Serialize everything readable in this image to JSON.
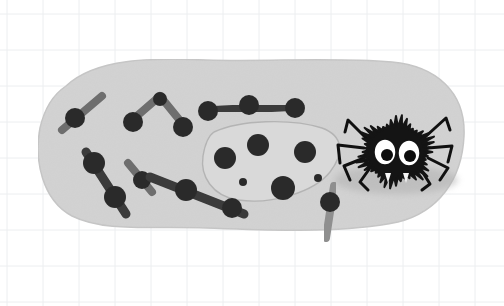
{
  "meta": {
    "title": "Spider on a rock illustration",
    "description": "Grayscale hand-drawn illustration on light grid paper: a fuzzy black cartoon spider with big white eyes sits on a large light-grey rounded blob, surrounded by matchstick-like shapes with dark round heads and an outlined inner patch containing dark dots.",
    "width": 504,
    "height": 306
  },
  "canvas": {
    "background_color": "#ffffff"
  },
  "grid": {
    "name": "graph-paper-grid",
    "line_color": "#eceef0",
    "line_width": 1,
    "spacing": 36,
    "offset_x": 7,
    "offset_y": 14,
    "columns": 14,
    "rows": 9
  },
  "palette": {
    "blob_fill": "#d2d2d2",
    "blob_edge": "#c6c6c6",
    "inner_patch_fill": "#d9d9d9",
    "inner_patch_stroke": "#b4b4b4",
    "shadow": "#b0b0b0",
    "stick_dark": "#3a3a3a",
    "stick_mid": "#6e6e6e",
    "stick_light": "#8f8f8f",
    "node_dark": "#2b2b2b",
    "spider_body": "#141414",
    "spider_leg": "#101010",
    "eye_white": "#ffffff",
    "eye_pupil": "#0d0d0d",
    "fang_white": "#f5f5f5"
  },
  "blob": {
    "name": "main-rock-blob",
    "label": "Large light grey rounded rock shape",
    "bounds": {
      "x": 38,
      "y": 58,
      "width": 428,
      "height": 174
    }
  },
  "shadow": {
    "name": "spider-shadow",
    "label": "Soft grey shadow beneath the spider",
    "cx": 396,
    "cy": 180,
    "rx": 62,
    "ry": 14
  },
  "inner_patch": {
    "name": "dotted-inner-patch",
    "label": "Outlined irregular patch containing dark dots",
    "dots": [
      {
        "cx": 258,
        "cy": 145,
        "r": 11
      },
      {
        "cx": 225,
        "cy": 158,
        "r": 11
      },
      {
        "cx": 305,
        "cy": 152,
        "r": 11
      },
      {
        "cx": 283,
        "cy": 188,
        "r": 12
      },
      {
        "cx": 243,
        "cy": 182,
        "r": 4
      },
      {
        "cx": 318,
        "cy": 178,
        "r": 4
      }
    ],
    "dot_count": 6
  },
  "sticks": [
    {
      "name": "stick-top-left-diagonal",
      "label": "Light diagonal stick with dark head, upper left",
      "tone": "mid",
      "path": "M 62 130 L 102 96",
      "nodes": [
        {
          "cx": 75,
          "cy": 118,
          "r": 10
        }
      ]
    },
    {
      "name": "stick-chevron-upper",
      "label": "Inverted V chevron stick with heads at both ends",
      "tone": "mid",
      "path": "M 130 122 L 160 96 L 186 128",
      "nodes": [
        {
          "cx": 133,
          "cy": 122,
          "r": 10
        },
        {
          "cx": 160,
          "cy": 99,
          "r": 7
        },
        {
          "cx": 183,
          "cy": 127,
          "r": 10
        }
      ]
    },
    {
      "name": "stick-top-horizontal-three-node",
      "label": "Horizontal dark stick with three round nodes",
      "tone": "dark",
      "path": "M 204 111 L 300 106",
      "nodes": [
        {
          "cx": 208,
          "cy": 111,
          "r": 10
        },
        {
          "cx": 249,
          "cy": 105,
          "r": 10
        },
        {
          "cx": 295,
          "cy": 108,
          "r": 10
        }
      ]
    },
    {
      "name": "stick-left-long-diagonal",
      "label": "Long dark diagonal stick, left side, two nodes",
      "tone": "dark",
      "path": "M 86 152 L 126 214",
      "nodes": [
        {
          "cx": 94,
          "cy": 163,
          "r": 11
        },
        {
          "cx": 115,
          "cy": 197,
          "r": 11
        }
      ]
    },
    {
      "name": "stick-mid-short-diagonal",
      "label": "Short mid-grey diagonal stick with dark head",
      "tone": "mid",
      "path": "M 128 163 L 152 192",
      "nodes": [
        {
          "cx": 142,
          "cy": 180,
          "r": 9
        }
      ]
    },
    {
      "name": "stick-lower-long-diagonal",
      "label": "Long dark diagonal stick running lower middle",
      "tone": "dark",
      "path": "M 150 177 L 244 214",
      "nodes": [
        {
          "cx": 186,
          "cy": 190,
          "r": 11
        },
        {
          "cx": 232,
          "cy": 208,
          "r": 10
        }
      ]
    },
    {
      "name": "stick-right-vertical",
      "label": "Light vertical stick with dark head crossing blob edge",
      "tone": "light",
      "path": "M 334 186 L 326 238",
      "nodes": [
        {
          "cx": 330,
          "cy": 202,
          "r": 10
        }
      ]
    }
  ],
  "spider": {
    "name": "spider-character",
    "label": "Fuzzy black cartoon spider with big white eyes and two fangs",
    "body": {
      "cx": 396,
      "cy": 152,
      "rx": 36,
      "ry": 32,
      "spike_count": 44
    },
    "eyes": [
      {
        "name": "left-eye",
        "cx": 385,
        "cy": 152,
        "rx": 11,
        "ry": 13,
        "pupil_cx": 387,
        "pupil_cy": 155,
        "pupil_r": 6
      },
      {
        "name": "right-eye",
        "cx": 409,
        "cy": 153,
        "rx": 11,
        "ry": 13,
        "pupil_cx": 410,
        "pupil_cy": 156,
        "pupil_r": 6
      }
    ],
    "fangs": [
      {
        "name": "left-fang",
        "points": "385,173 391,173 388,183"
      },
      {
        "name": "right-fang",
        "points": "403,173 409,173 406,183"
      }
    ],
    "legs": [
      {
        "name": "leg-left-1",
        "path": "M 368 140 L 348 120 L 345 132"
      },
      {
        "name": "leg-left-2",
        "path": "M 364 148 L 338 145 L 340 163"
      },
      {
        "name": "leg-left-3",
        "path": "M 364 158 L 344 166 L 350 180"
      },
      {
        "name": "leg-left-4",
        "path": "M 370 168 L 360 182 L 368 190"
      },
      {
        "name": "leg-right-1",
        "path": "M 424 138 L 446 118 L 450 130"
      },
      {
        "name": "leg-right-2",
        "path": "M 428 148 L 452 146 L 448 162"
      },
      {
        "name": "leg-right-3",
        "path": "M 428 158 L 448 168 L 440 180"
      },
      {
        "name": "leg-right-4",
        "path": "M 420 168 L 430 184 L 422 190"
      }
    ]
  }
}
